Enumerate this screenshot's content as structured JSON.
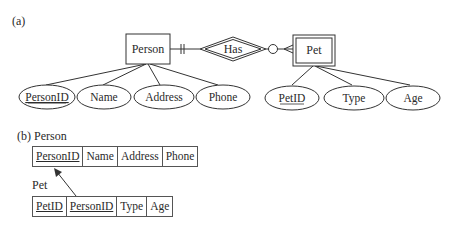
{
  "part_a": {
    "label": "(a)",
    "entities": {
      "person": {
        "name": "Person",
        "type": "strong"
      },
      "pet": {
        "name": "Pet",
        "type": "weak"
      }
    },
    "relationship": {
      "name": "Has",
      "type": "identifying"
    },
    "cardinality": {
      "person_side": "exactly-one",
      "pet_side": "zero-or-many"
    },
    "person_attributes": [
      {
        "name": "PersonID",
        "key": true
      },
      {
        "name": "Name",
        "key": false
      },
      {
        "name": "Address",
        "key": false
      },
      {
        "name": "Phone",
        "key": false
      }
    ],
    "pet_attributes": [
      {
        "name": "PetID",
        "key": true
      },
      {
        "name": "Type",
        "key": false
      },
      {
        "name": "Age",
        "key": false
      }
    ]
  },
  "part_b": {
    "label": "(b) Person",
    "person_table": {
      "name": "Person",
      "columns": [
        "PersonID",
        "Name",
        "Address",
        "Phone"
      ],
      "primary_key": [
        "PersonID"
      ]
    },
    "pet_label": "Pet",
    "pet_table": {
      "name": "Pet",
      "columns": [
        "PetID",
        "PersonID",
        "Type",
        "Age"
      ],
      "primary_key": [
        "PetID",
        "PersonID"
      ],
      "foreign_key": {
        "column": "PersonID",
        "references": "Person.PersonID"
      }
    }
  }
}
